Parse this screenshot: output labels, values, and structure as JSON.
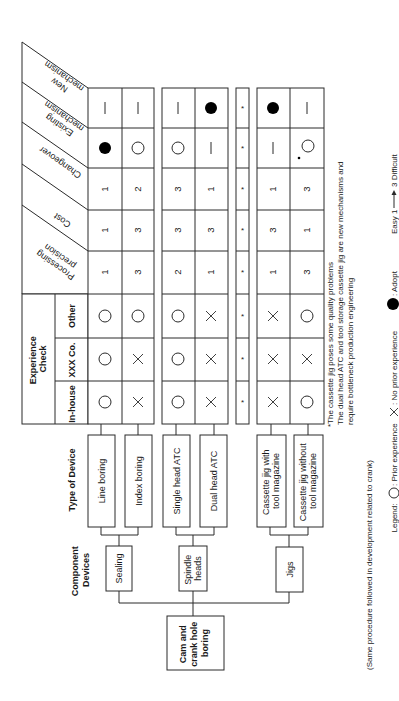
{
  "title_root": [
    "Cam and",
    "crank hole",
    "boring"
  ],
  "labels": {
    "component_devices": [
      "Component",
      "Devices"
    ],
    "type_of_device": "Type of Device",
    "experience_check": [
      "Experience",
      "Check"
    ]
  },
  "components": [
    {
      "name": "Sealing",
      "lines": [
        "Sealing"
      ]
    },
    {
      "name": "Spindle heads",
      "lines": [
        "Spindle",
        "heads"
      ]
    },
    {
      "name": "Jigs",
      "lines": [
        "Jigs"
      ]
    }
  ],
  "devices": [
    {
      "name": "Line boring",
      "lines": [
        "Line boring"
      ],
      "component": "Sealing"
    },
    {
      "name": "Index boring",
      "lines": [
        "Index boring"
      ],
      "component": "Sealing"
    },
    {
      "name": "Single head ATC",
      "lines": [
        "Single head ATC"
      ],
      "component": "Spindle heads"
    },
    {
      "name": "Dual head ATC",
      "lines": [
        "Dual head ATC"
      ],
      "component": "Spindle heads"
    },
    {
      "name": "Cassette jig with tool magazine",
      "lines": [
        "Cassette jig with",
        "tool magazine"
      ],
      "component": "Jigs"
    },
    {
      "name": "Cassette jig without tool magazine",
      "lines": [
        "Cassette jig without",
        "tool magazine"
      ],
      "component": "Jigs"
    }
  ],
  "experience_columns": [
    "In-house",
    "XXX Co.",
    "Other"
  ],
  "evaluation_columns": [
    "Processing precision",
    "Cost",
    "Changeover",
    "Existing mechanism",
    "New mechanism"
  ],
  "evaluation_column_lines": [
    [
      "Processing",
      "precision"
    ],
    [
      "Cost"
    ],
    [
      "Changeover"
    ],
    [
      "Existing",
      "mechanism"
    ],
    [
      "New",
      "mechanism"
    ]
  ],
  "table": {
    "rows": [
      {
        "device": "Line boring",
        "in_house": "circle",
        "xxx_co": "circle",
        "other": "circle",
        "processing_precision": "1",
        "cost": "1",
        "changeover": "1",
        "existing_mechanism": "adopt",
        "new_mechanism": "dash"
      },
      {
        "device": "Index boring",
        "in_house": "cross",
        "xxx_co": "cross",
        "other": "circle",
        "processing_precision": "3",
        "cost": "3",
        "changeover": "2",
        "existing_mechanism": "circle",
        "new_mechanism": "dash"
      },
      {
        "device": "Single head ATC",
        "in_house": "circle",
        "xxx_co": "circle",
        "other": "circle",
        "processing_precision": "2",
        "cost": "3",
        "changeover": "3",
        "existing_mechanism": "circle",
        "new_mechanism": "dash"
      },
      {
        "device": "Dual head ATC",
        "in_house": "cross",
        "xxx_co": "cross",
        "other": "cross",
        "processing_precision": "1",
        "cost": "3",
        "changeover": "1",
        "existing_mechanism": "dash",
        "new_mechanism": "adopt"
      },
      {
        "device": "(separator)",
        "in_house": "*",
        "xxx_co": "*",
        "other": "*",
        "processing_precision": "*",
        "cost": "*",
        "changeover": "*",
        "existing_mechanism": "*",
        "new_mechanism": "*"
      },
      {
        "device": "Cassette jig with tool magazine",
        "in_house": "cross",
        "xxx_co": "cross",
        "other": "cross",
        "processing_precision": "1",
        "cost": "3",
        "changeover": "1",
        "existing_mechanism": "dash",
        "new_mechanism": "adopt"
      },
      {
        "device": "Cassette jig without tool magazine",
        "in_house": "circle",
        "xxx_co": "cross",
        "other": "circle",
        "processing_precision": "3",
        "cost": "1",
        "changeover": "3",
        "existing_mechanism": "*circle",
        "new_mechanism": "dash"
      }
    ]
  },
  "notes": [
    "*The cassette jig poses some quality problems",
    "The dual head ATC and tool storage cassette jig are new mechanisms and",
    "require bottleneck production engineering"
  ],
  "footer_note": "(Same procedure followed in development related to crank)",
  "legend": {
    "title": "Legend:",
    "prior_experience": ": Prior experience",
    "no_prior_experience": ": No prior experience",
    "adopt": ": Adopt",
    "scale": "Easy 1 → 3 Difficult",
    "scale_left": "Easy 1",
    "scale_right": "3 Difficult"
  }
}
